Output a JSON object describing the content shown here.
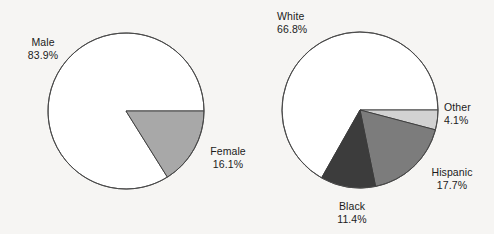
{
  "figure": {
    "background_color": "#f6f5f3",
    "outline_color": "#4a4a4a",
    "text_color": "#1b1b1b"
  },
  "chart_data": [
    {
      "type": "pie",
      "name": "gender-pie",
      "title": "",
      "categories": [
        "Male",
        "Female"
      ],
      "values": [
        83.9,
        16.1
      ],
      "labels": [
        "83.9%",
        "16.1%"
      ],
      "colors": [
        "#ffffff",
        "#a8a8a8"
      ],
      "start_angle_deg": 0,
      "direction": "clockwise",
      "legend": "none",
      "grid": false,
      "center": [
        126,
        111
      ],
      "radius": 78
    },
    {
      "type": "pie",
      "name": "race-pie",
      "title": "",
      "categories": [
        "White",
        "Other",
        "Hispanic",
        "Black"
      ],
      "values": [
        66.8,
        4.1,
        17.7,
        11.4
      ],
      "labels": [
        "66.8%",
        "4.1%",
        "17.7%",
        "11.4%"
      ],
      "colors": [
        "#ffffff",
        "#d2d2d2",
        "#7c7c7c",
        "#3c3c3c"
      ],
      "start_angle_deg": 0,
      "direction": "clockwise",
      "legend": "none",
      "grid": false,
      "center": [
        360,
        110
      ],
      "radius": 78
    }
  ],
  "left_chart": {
    "male": {
      "name": "Male",
      "pct": "83.9%"
    },
    "female": {
      "name": "Female",
      "pct": "16.1%"
    }
  },
  "right_chart": {
    "white": {
      "name": "White",
      "pct": "66.8%"
    },
    "other": {
      "name": "Other",
      "pct": "4.1%"
    },
    "hispanic": {
      "name": "Hispanic",
      "pct": "17.7%"
    },
    "black": {
      "name": "Black",
      "pct": "11.4%"
    }
  }
}
